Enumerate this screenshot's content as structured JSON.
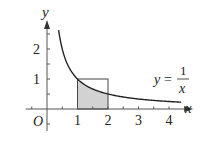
{
  "chart_data": {
    "type": "line",
    "title": "",
    "function_label": "y = 1/x",
    "function_label_parts": {
      "lhs": "y",
      "eq": "=",
      "numerator": "1",
      "denominator": "x"
    },
    "xlabel": "x",
    "ylabel": "y",
    "origin_label": "O",
    "x_ticks": [
      1,
      2,
      3,
      4
    ],
    "y_ticks": [
      1,
      2
    ],
    "x_tick_labels": [
      "1",
      "2",
      "3",
      "4"
    ],
    "y_tick_labels": [
      "1",
      "2"
    ],
    "minor_tick_step": 0.5,
    "xlim": [
      -0.5,
      4.4
    ],
    "ylim": [
      -0.6,
      2.9
    ],
    "series": [
      {
        "name": "y = 1/x",
        "x": [
          0.38,
          0.5,
          0.75,
          1,
          1.5,
          2,
          3,
          4,
          4.4
        ],
        "y": [
          2.63,
          2,
          1.333,
          1,
          0.667,
          0.5,
          0.333,
          0.25,
          0.227
        ]
      }
    ],
    "shaded_region": {
      "description": "area under y = 1/x from x = 1 to x = 2",
      "x_from": 1,
      "x_to": 2,
      "color": "#d2d2d2"
    },
    "rectangle": {
      "x_from": 1,
      "x_to": 2,
      "y_from": 0,
      "y_to": 1
    },
    "grid": false,
    "legend": null
  },
  "colors": {
    "axis": "#555555",
    "curve": "#222222",
    "shade": "#d2d2d2",
    "background": "#ffffff"
  }
}
